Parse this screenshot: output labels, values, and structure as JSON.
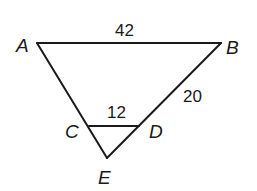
{
  "diagram": {
    "type": "geometry-triangle",
    "vertices": {
      "A": {
        "label": "A",
        "x": 37,
        "y": 43
      },
      "B": {
        "label": "B",
        "x": 221,
        "y": 43
      },
      "C": {
        "label": "C",
        "x": 89,
        "y": 126
      },
      "D": {
        "label": "D",
        "x": 139,
        "y": 126
      },
      "E": {
        "label": "E",
        "x": 107,
        "y": 158
      }
    },
    "segments": [
      {
        "from": "A",
        "to": "B",
        "measure": "42"
      },
      {
        "from": "A",
        "to": "E",
        "measure": ""
      },
      {
        "from": "B",
        "to": "E",
        "measure": ""
      },
      {
        "from": "C",
        "to": "D",
        "measure": "12"
      },
      {
        "from": "B",
        "to": "D",
        "measure": "20"
      }
    ],
    "labels": {
      "A": "A",
      "B": "B",
      "C": "C",
      "D": "D",
      "E": "E",
      "AB": "42",
      "BD": "20",
      "CD": "12"
    },
    "stroke_color": "#1a1a1a",
    "background": "#ffffff"
  }
}
